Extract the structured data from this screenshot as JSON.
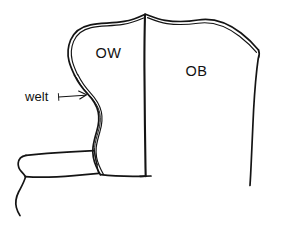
{
  "figure": {
    "type": "line-drawing",
    "background_color": "#ffffff",
    "ink_color": "#141414",
    "width": 281,
    "height": 229
  },
  "labels": {
    "front_panel": "OW",
    "back_panel": "OB",
    "welt_callout": "welt"
  },
  "parts": {
    "front_panel_name": "ow-panel",
    "back_panel_name": "ob-panel",
    "center_seam_name": "center-seam-line",
    "welt_edge_name": "welt-edge",
    "sleeve_band_name": "sleeve-band",
    "sleeve_tail_name": "sleeve-tail",
    "callout_arrow_name": "welt-arrow"
  }
}
